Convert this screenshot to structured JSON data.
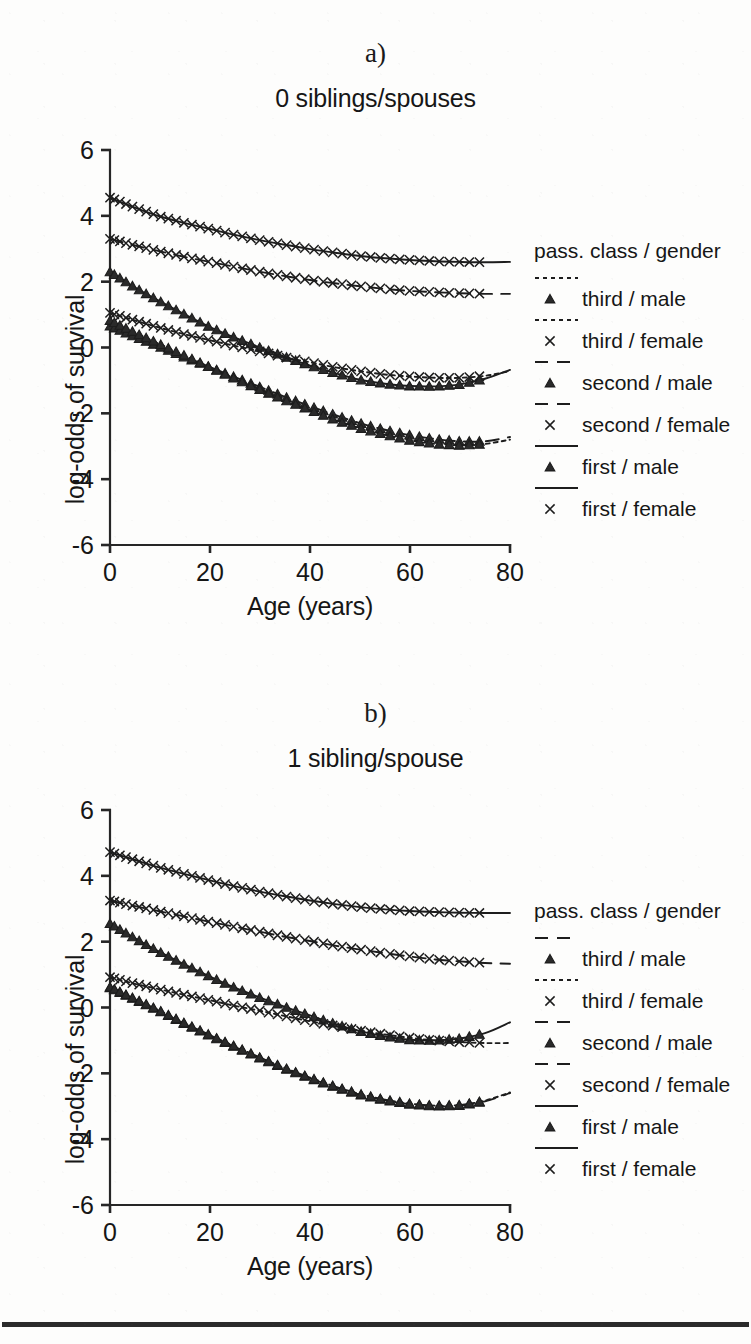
{
  "figure": {
    "background_color": "#fdfdfc",
    "ink_color": "#1d1d1d",
    "bottom_rule": true
  },
  "panels": [
    {
      "letter": "a)",
      "title": "0 siblings/spouses",
      "xlabel": "Age (years)",
      "ylabel": "log-odds of survival",
      "legend_title": "pass. class / gender"
    },
    {
      "letter": "b)",
      "title": "1 sibling/spouse",
      "xlabel": "Age (years)",
      "ylabel": "log-odds of survival",
      "legend_title": "pass. class / gender"
    }
  ],
  "chart_data": [
    {
      "type": "line",
      "title": "0 siblings/spouses",
      "panel": "a)",
      "xlabel": "Age (years)",
      "ylabel": "log-odds of survival",
      "xlim": [
        0,
        80
      ],
      "ylim": [
        -6,
        6
      ],
      "xticks": [
        0,
        20,
        40,
        60,
        80
      ],
      "yticks": [
        6,
        4,
        2,
        0,
        -2,
        -4,
        -6
      ],
      "grid": false,
      "legend_position": "right",
      "legend_title": "pass. class / gender",
      "x": [
        0,
        5,
        10,
        15,
        20,
        25,
        30,
        35,
        40,
        45,
        50,
        55,
        60,
        65,
        70,
        75,
        80
      ],
      "series": [
        {
          "name": "first / female",
          "marker": "x",
          "linestyle": "solid",
          "values": [
            4.55,
            4.25,
            3.98,
            3.78,
            3.6,
            3.42,
            3.26,
            3.12,
            2.99,
            2.88,
            2.78,
            2.71,
            2.66,
            2.62,
            2.6,
            2.59,
            2.6
          ]
        },
        {
          "name": "second / female",
          "marker": "x",
          "linestyle": "dashed",
          "values": [
            3.3,
            3.1,
            2.92,
            2.75,
            2.6,
            2.45,
            2.3,
            2.17,
            2.05,
            1.95,
            1.86,
            1.78,
            1.72,
            1.68,
            1.65,
            1.63,
            1.63
          ]
        },
        {
          "name": "first / male",
          "marker": "triangle",
          "linestyle": "solid",
          "values": [
            2.3,
            1.82,
            1.4,
            1.0,
            0.62,
            0.3,
            0.0,
            -0.28,
            -0.55,
            -0.78,
            -0.98,
            -1.1,
            -1.17,
            -1.18,
            -1.12,
            -0.95,
            -0.68
          ]
        },
        {
          "name": "third / female",
          "marker": "x",
          "linestyle": "dotted",
          "values": [
            1.05,
            0.82,
            0.6,
            0.4,
            0.22,
            0.05,
            -0.12,
            -0.3,
            -0.45,
            -0.6,
            -0.72,
            -0.82,
            -0.88,
            -0.92,
            -0.92,
            -0.86,
            -0.72
          ]
        },
        {
          "name": "second / male",
          "marker": "triangle",
          "linestyle": "dashed",
          "values": [
            0.65,
            0.32,
            0.02,
            -0.3,
            -0.6,
            -0.9,
            -1.2,
            -1.5,
            -1.78,
            -2.05,
            -2.3,
            -2.5,
            -2.66,
            -2.78,
            -2.85,
            -2.85,
            -2.72
          ]
        },
        {
          "name": "third / male",
          "marker": "triangle",
          "linestyle": "dotted",
          "values": [
            0.82,
            0.45,
            0.1,
            -0.25,
            -0.6,
            -0.95,
            -1.28,
            -1.6,
            -1.9,
            -2.2,
            -2.45,
            -2.65,
            -2.82,
            -2.93,
            -2.97,
            -2.93,
            -2.8
          ]
        }
      ],
      "legend_entries": [
        {
          "label": "third / male",
          "marker": "triangle",
          "linestyle": "dotted"
        },
        {
          "label": "third / female",
          "marker": "x",
          "linestyle": "dotted"
        },
        {
          "label": "second / male",
          "marker": "triangle",
          "linestyle": "dashed"
        },
        {
          "label": "second / female",
          "marker": "x",
          "linestyle": "dashed"
        },
        {
          "label": "first / male",
          "marker": "triangle",
          "linestyle": "solid"
        },
        {
          "label": "first / female",
          "marker": "x",
          "linestyle": "solid"
        }
      ]
    },
    {
      "type": "line",
      "title": "1 sibling/spouse",
      "panel": "b)",
      "xlabel": "Age (years)",
      "ylabel": "log-odds of survival",
      "xlim": [
        0,
        80
      ],
      "ylim": [
        -6,
        6
      ],
      "xticks": [
        0,
        20,
        40,
        60,
        80
      ],
      "yticks": [
        6,
        4,
        2,
        0,
        -2,
        -4,
        -6
      ],
      "grid": false,
      "legend_position": "right",
      "legend_title": "pass. class / gender",
      "x": [
        0,
        5,
        10,
        15,
        20,
        25,
        30,
        35,
        40,
        45,
        50,
        55,
        60,
        65,
        70,
        75,
        80
      ],
      "series": [
        {
          "name": "first / female",
          "marker": "x",
          "linestyle": "solid",
          "values": [
            4.72,
            4.48,
            4.25,
            4.05,
            3.86,
            3.68,
            3.52,
            3.38,
            3.25,
            3.14,
            3.05,
            2.98,
            2.93,
            2.9,
            2.88,
            2.87,
            2.87
          ]
        },
        {
          "name": "second / female",
          "marker": "x",
          "linestyle": "dashed",
          "values": [
            3.25,
            3.08,
            2.92,
            2.76,
            2.6,
            2.45,
            2.3,
            2.15,
            2.02,
            1.88,
            1.76,
            1.65,
            1.55,
            1.46,
            1.4,
            1.35,
            1.33
          ]
        },
        {
          "name": "first / male",
          "marker": "triangle",
          "linestyle": "solid",
          "values": [
            2.55,
            2.1,
            1.68,
            1.3,
            0.94,
            0.6,
            0.3,
            0.02,
            -0.24,
            -0.5,
            -0.72,
            -0.88,
            -0.98,
            -1.0,
            -0.94,
            -0.78,
            -0.45
          ]
        },
        {
          "name": "third / female",
          "marker": "x",
          "linestyle": "dotted",
          "values": [
            0.92,
            0.72,
            0.55,
            0.38,
            0.22,
            0.05,
            -0.1,
            -0.26,
            -0.42,
            -0.56,
            -0.7,
            -0.82,
            -0.92,
            -1.0,
            -1.05,
            -1.08,
            -1.08
          ]
        },
        {
          "name": "second / male",
          "marker": "triangle",
          "linestyle": "dashed",
          "values": [
            0.6,
            0.24,
            -0.12,
            -0.5,
            -0.86,
            -1.2,
            -1.54,
            -1.86,
            -2.15,
            -2.42,
            -2.65,
            -2.82,
            -2.94,
            -3.0,
            -2.98,
            -2.85,
            -2.6
          ]
        },
        {
          "name": "third / male",
          "marker": "triangle",
          "linestyle": "dotted",
          "values": [
            0.62,
            0.26,
            -0.1,
            -0.48,
            -0.84,
            -1.18,
            -1.52,
            -1.84,
            -2.13,
            -2.4,
            -2.63,
            -2.8,
            -2.92,
            -2.98,
            -2.96,
            -2.83,
            -2.58
          ]
        }
      ],
      "legend_entries": [
        {
          "label": "third / male",
          "marker": "triangle",
          "linestyle": "dashed"
        },
        {
          "label": "third / female",
          "marker": "x",
          "linestyle": "dotted"
        },
        {
          "label": "second / male",
          "marker": "triangle",
          "linestyle": "dashed"
        },
        {
          "label": "second / female",
          "marker": "x",
          "linestyle": "dashed"
        },
        {
          "label": "first / male",
          "marker": "triangle",
          "linestyle": "solid"
        },
        {
          "label": "first / female",
          "marker": "x",
          "linestyle": "solid"
        }
      ]
    }
  ]
}
